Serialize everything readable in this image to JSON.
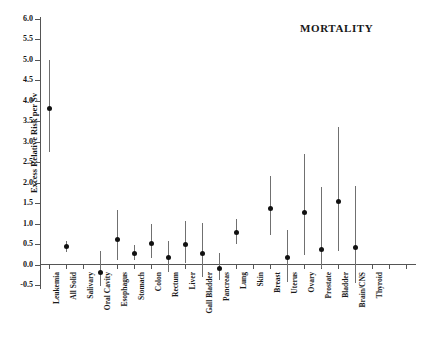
{
  "chart_data": {
    "type": "scatter",
    "title": "MORTALITY",
    "xlabel": "",
    "ylabel": "Excess Relative Risk per Sv",
    "ylim": [
      -0.5,
      6.0
    ],
    "ytick_labels": [
      "6.0",
      "5.5",
      "5.0",
      "4.5",
      "4.0",
      "3.5",
      "3.0",
      "2.5",
      "2.0",
      "1.5",
      "1.0",
      "0.5",
      "0.0",
      "-0.5"
    ],
    "ytick_values": [
      6.0,
      5.5,
      5.0,
      4.5,
      4.0,
      3.5,
      3.0,
      2.5,
      2.0,
      1.5,
      1.0,
      0.5,
      0.0,
      -0.5
    ],
    "grid": false,
    "legend": "none",
    "categories": [
      "Leukemia",
      "All Solid",
      "Salivary",
      "Oral Cavity",
      "Esophagus",
      "Stomach",
      "Colon",
      "Rectum",
      "Liver",
      "Gall Bladder",
      "Pancreas",
      "Lung",
      "Skin",
      "Breast",
      "Uterus",
      "Ovary",
      "Prostate",
      "Bladder",
      "Brain/CNS",
      "Thyroid"
    ],
    "values": [
      3.8,
      0.44,
      null,
      -0.2,
      0.62,
      0.28,
      0.52,
      0.16,
      0.48,
      0.28,
      -0.1,
      0.78,
      null,
      1.37,
      0.16,
      1.26,
      0.36,
      1.53,
      0.42,
      null
    ],
    "ci_low": [
      2.75,
      0.31,
      null,
      -0.52,
      0.12,
      0.1,
      0.16,
      -0.18,
      0.04,
      -0.3,
      -0.38,
      0.5,
      null,
      0.72,
      -0.42,
      0.22,
      -0.08,
      0.33,
      -0.45,
      null
    ],
    "ci_high": [
      5.0,
      0.58,
      null,
      0.33,
      1.32,
      0.48,
      1.0,
      0.58,
      1.05,
      1.02,
      0.28,
      1.12,
      null,
      2.15,
      0.84,
      2.7,
      1.9,
      3.35,
      1.92,
      null
    ],
    "series_name": "Excess relative risk with 90% confidence interval",
    "marker": "filled-circle",
    "marker_color": "#111111",
    "errorbar_color": "#707070",
    "axis_color": "#555555"
  }
}
